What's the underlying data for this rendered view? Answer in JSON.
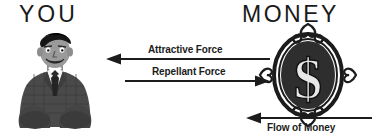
{
  "diagram": {
    "background_color": "#ffffff",
    "ink_color": "#1c1c1c",
    "headings": {
      "left": "YOU",
      "right": "MONEY"
    },
    "arrows": [
      {
        "id": "attractive-force",
        "label": "Attractive Force",
        "direction": "left",
        "from": "MONEY",
        "to": "YOU",
        "y": 59
      },
      {
        "id": "repellant-force",
        "label": "Repellant Force",
        "direction": "right",
        "from": "YOU",
        "to": "MONEY",
        "y": 81
      },
      {
        "id": "flow-of-money",
        "label": "Flow of Money",
        "direction": "left",
        "from": "right",
        "to": "MONEY",
        "y": 118
      }
    ],
    "figures": [
      {
        "id": "person",
        "name": "man-in-suit-illustration",
        "description": "Cartoon man in dark suit, white shirt and dark tie"
      },
      {
        "id": "medallion",
        "name": "dollar-medallion-illustration",
        "description": "Ornate oval medallion containing a dollar sign",
        "symbol": "$"
      }
    ]
  }
}
